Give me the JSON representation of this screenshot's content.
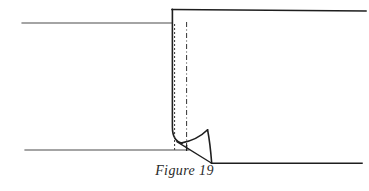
{
  "figure": {
    "caption": "Figure 19",
    "kind": "technical-line-drawing",
    "canvas": {
      "width": 369,
      "height": 191,
      "background": "#ffffff"
    },
    "colors": {
      "line": "#1e1e1e",
      "thin_line": "#4a4a4a",
      "dashed_line": "#333333",
      "caption_text": "#2a2a2a",
      "background": "#ffffff"
    },
    "strokes": {
      "solid_main_width": 1.6,
      "thin_width": 1.1,
      "dashed_width": 1.0
    },
    "elements": [
      {
        "name": "upper-left-surface-line",
        "type": "polyline",
        "points": "22,23 172,23",
        "style": "thin-solid"
      },
      {
        "name": "top-surface-line",
        "type": "polyline",
        "points": "172,9 366,11",
        "style": "solid"
      },
      {
        "name": "step-vertical-edge",
        "type": "path",
        "d": "M 172.4,9 L 172.4,127 C 172.4,136.5 175.2,141.6 182,143.0",
        "style": "solid"
      },
      {
        "name": "dashed-line-inner",
        "type": "line",
        "points": "174.5,24 174.5,150",
        "style": "dashed",
        "dash_pattern": "2,2"
      },
      {
        "name": "dash-dot-line-outer",
        "type": "line",
        "points": "186.5,22 186.5,150",
        "style": "dash-dot",
        "dash_pattern": "5,2.5,1,2.5"
      },
      {
        "name": "lower-left-surface-line",
        "type": "polyline",
        "points": "25,150 189,150",
        "style": "thin-solid"
      },
      {
        "name": "bottom-right-surface-line",
        "type": "polyline",
        "points": "212,163 362,163",
        "style": "solid"
      },
      {
        "name": "eddy-upper-concave-curve",
        "type": "path",
        "d": "M 180.5,142.6 C 191,141.0 200,137.5 207.5,130.0",
        "style": "solid"
      },
      {
        "name": "eddy-right-convex-edge",
        "type": "path",
        "d": "M 207.5,130.0 C 209.8,142.0 210.8,154.0 211.8,163.2",
        "style": "solid"
      },
      {
        "name": "eddy-diagonal-shear-line",
        "type": "line",
        "points": "176.5,141.5 211.8,163.2",
        "style": "solid"
      },
      {
        "name": "eddy-base-tick",
        "type": "line",
        "points": "186.5,145.5 186.5,150.5",
        "style": "solid"
      }
    ]
  }
}
